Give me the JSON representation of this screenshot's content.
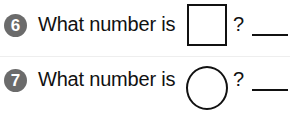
{
  "questions": [
    {
      "number": "6",
      "prompt": "What number is",
      "shape": "square",
      "suffix": "?",
      "answer": ""
    },
    {
      "number": "7",
      "prompt": "What number is",
      "shape": "circle",
      "suffix": "?",
      "answer": ""
    }
  ],
  "colors": {
    "badge": "#6b6b6b",
    "text": "#111111"
  }
}
